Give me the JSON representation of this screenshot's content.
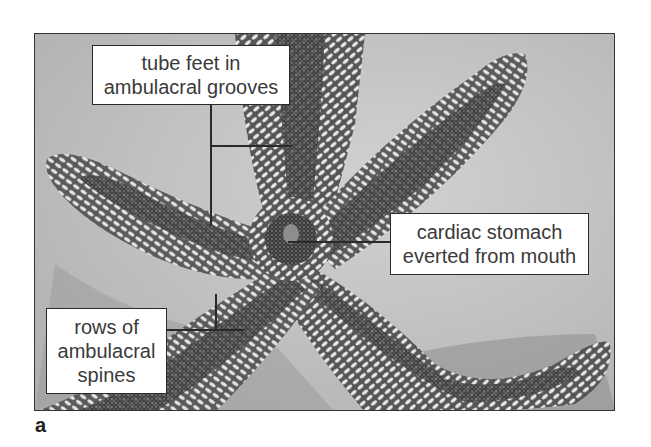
{
  "figure": {
    "panel_letter": "a",
    "labels": [
      {
        "id": "tube-feet",
        "lines": [
          "tube feet in",
          "ambulacral grooves"
        ]
      },
      {
        "id": "cardiac-stomach",
        "lines": [
          "cardiac stomach",
          "everted from mouth"
        ]
      },
      {
        "id": "ambulacral-spines",
        "lines": [
          "rows of",
          "ambulacral",
          "spines"
        ]
      }
    ]
  },
  "colors": {
    "background": "#c9c9c9",
    "label_border": "#2a2a2a",
    "label_text": "#3a3a3a",
    "leader_line": "#2a2a2a"
  }
}
